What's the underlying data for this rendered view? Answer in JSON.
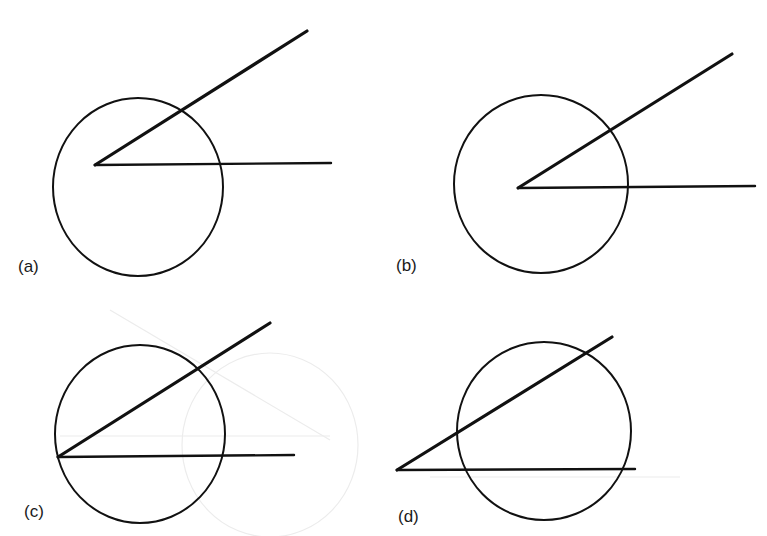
{
  "figure": {
    "stroke_color": "#111111",
    "ghost_color": "#e6e6e6",
    "panels": [
      {
        "id": "a",
        "label": "(a)",
        "label_pos": [
          18,
          257
        ],
        "circle": {
          "cx": 138,
          "cy": 187,
          "rx": 85,
          "ry": 89
        },
        "vertex": [
          95,
          165
        ],
        "upper_ray_end": [
          307,
          31
        ],
        "horizontal_ray_end": [
          331,
          163
        ],
        "description": "Angle vertex inside the circle, off-center"
      },
      {
        "id": "b",
        "label": "(b)",
        "label_pos": [
          396,
          256
        ],
        "circle": {
          "cx": 541,
          "cy": 184,
          "rx": 87,
          "ry": 89
        },
        "vertex": [
          518,
          188
        ],
        "upper_ray_end": [
          732,
          54
        ],
        "horizontal_ray_end": [
          755,
          186
        ],
        "description": "Angle vertex near the center of the circle"
      },
      {
        "id": "c",
        "label": "(c)",
        "label_pos": [
          24,
          502
        ],
        "circle": {
          "cx": 140,
          "cy": 434,
          "rx": 85,
          "ry": 89
        },
        "vertex": [
          58,
          457
        ],
        "upper_ray_end": [
          270,
          323
        ],
        "horizontal_ray_end": [
          294,
          455
        ],
        "description": "Angle vertex on the circle"
      },
      {
        "id": "d",
        "label": "(d)",
        "label_pos": [
          398,
          507
        ],
        "circle": {
          "cx": 544,
          "cy": 431,
          "rx": 87,
          "ry": 89
        },
        "vertex": [
          397,
          470
        ],
        "upper_ray_end": [
          612,
          337
        ],
        "horizontal_ray_end": [
          635,
          469
        ],
        "description": "Angle vertex outside the circle, both rays are secants"
      }
    ]
  }
}
